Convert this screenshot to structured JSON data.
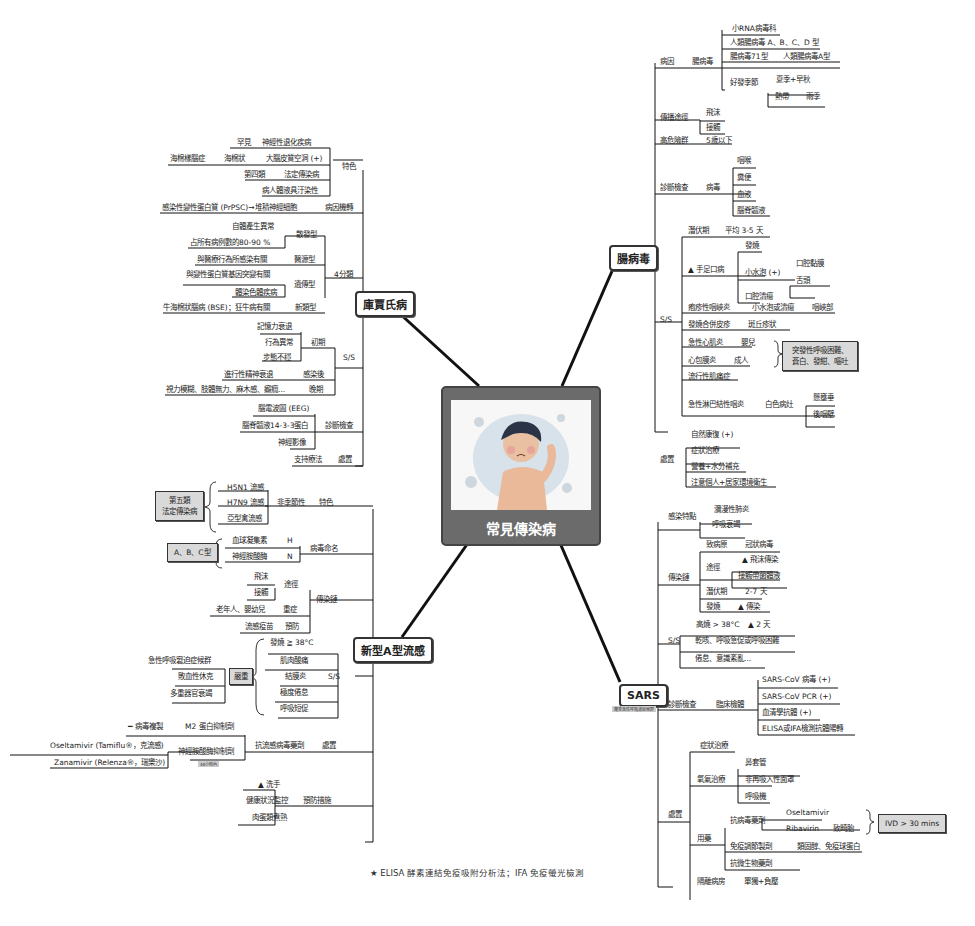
{
  "center": {
    "title": "常見傳染病",
    "image": "sick-child-illustration"
  },
  "footnote": {
    "icon": "star-icon",
    "text": "★ ELISA 酵素連結免疫吸附分析法；IFA 免疫螢光檢測"
  },
  "enterovirus": {
    "label": "腸病毒",
    "cause": {
      "label": "病因",
      "virus": "腸病毒",
      "items": [
        "小RNA病毒科",
        "人類腸病毒 A、B、C、D 型",
        "腸病毒71型",
        "人類腸病毒A型",
        "好發季節",
        "夏季+早秋",
        "熱帶",
        "雨季"
      ]
    },
    "transmission": {
      "label": "傳播途徑",
      "items": [
        "飛沫",
        "接觸"
      ]
    },
    "high_risk": {
      "label": "高危險群",
      "value": "5歲以下"
    },
    "diagnosis": {
      "label": "診斷檢查",
      "sub": "病毒",
      "items": [
        "咽喉",
        "糞便",
        "血液",
        "腦脊髓液"
      ]
    },
    "ss": {
      "label": "S/S",
      "incubation": {
        "label": "潛伏期",
        "value": "平均 3-5 天"
      },
      "hfmd": {
        "label": "手足口病",
        "items": [
          "發燒",
          "小水泡 (+)",
          "口腔黏膜",
          "舌頭",
          "口腔潰瘍"
        ]
      },
      "herpangina": {
        "label": "疱疹性咽峽炎",
        "a": "小水泡或潰瘍",
        "b": "咽峽部"
      },
      "rash": {
        "label": "發燒合併皮疹",
        "value": "斑丘疹狀"
      },
      "myocarditis": {
        "label": "急性心肌炎",
        "value": "嬰兒"
      },
      "pericarditis": {
        "label": "心包膜炎",
        "value": "成人"
      },
      "note": "突發性呼吸困難、蒼白、發紺、嘔吐",
      "myalgia": "流行性肌痛症",
      "pharyngitis": {
        "label": "急性淋巴結性咽炎",
        "value": "白色病灶",
        "items": [
          "懸壅垂",
          "後咽壁"
        ]
      }
    },
    "treatment": {
      "label": "處置",
      "items": [
        "自然康復 (+)",
        "症狀治療",
        "營養+水分補充",
        "注意個人+居家環境衛生"
      ]
    }
  },
  "cjd": {
    "label": "庫賈氏病",
    "features": {
      "label": "特色",
      "items": [
        "罕見",
        "神經性退化疾病",
        "海棉樣腦症",
        "海棉狀",
        "大腦皮質空洞 (+)",
        "第四類",
        "法定傳染病",
        "病人體液具汙染性"
      ]
    },
    "mechanism": {
      "label": "病因機轉",
      "value": "感染性變性蛋白質 (PrPSC)→堆積神經細胞"
    },
    "types": {
      "label": "4分類",
      "items": [
        "自體產生異常",
        "散發型",
        "占所有病例數的80-90 %",
        "與醫療行為所感染有關",
        "醫源型",
        "與變性蛋白質基因突變有關",
        "遺傳型",
        "體染色體疾病",
        "牛海棉狀腦病 (BSE)；狂牛病有關",
        "新類型"
      ]
    },
    "ss": {
      "label": "S/S",
      "items": [
        "記憶力衰退",
        "行為異常",
        "初期",
        "步態不穩",
        "進行性精神衰退",
        "感染後",
        "視力模糊、肢體無力、麻木感、癲癇...",
        "晚期"
      ]
    },
    "diagnosis": {
      "label": "診斷檢查",
      "items": [
        "腦電波圖 (EEG)",
        "腦脊髓液14-3-3蛋白",
        "神經影像"
      ]
    },
    "treatment": {
      "label": "處置",
      "value": "支持療法"
    }
  },
  "flu": {
    "label": "新型A型流感",
    "features": {
      "label": "特色",
      "sub": "非季節性",
      "items": [
        "H5N1 流感",
        "H7N9 流感",
        "亞型禽流感"
      ],
      "box": "第五類\n法定傳染病"
    },
    "naming": {
      "label": "病毒命名",
      "items": [
        "血球凝集素",
        "H",
        "神經胺酸酶",
        "N"
      ],
      "box": "A、B、C型"
    },
    "chain": {
      "label": "傳染鏈",
      "items": [
        "飛沫",
        "接觸",
        "途徑",
        "老年人、嬰幼兒",
        "重症",
        "流感疫苗",
        "預防"
      ]
    },
    "ss": {
      "label": "S/S",
      "items": [
        "發燒 ≧ 38°C",
        "肌肉酸痛",
        "結膜炎",
        "極度倦怠",
        "呼吸短促"
      ],
      "severe": "嚴重",
      "severe_items": [
        "急性呼吸窘迫症候群",
        "敗血性休克",
        "多重器官衰竭"
      ]
    },
    "treatment": {
      "label": "處置",
      "sub": "抗流感病毒藥劑",
      "items": [
        "病毒複製",
        "M2 蛋白抑制劑",
        "Oseltamivir (Tamiflu®，克流感)",
        "神經胺酸酶抑制劑",
        "Zanamivir (Relenza®，瑞樂沙)"
      ],
      "tag": "48小時內"
    },
    "prevention": {
      "label": "預防措施",
      "items": [
        "洗手",
        "健康狀況監控",
        "肉蛋類煮熟"
      ]
    }
  },
  "sars": {
    "label": "SARS",
    "sublabel": "嚴重急性呼吸道症候群",
    "features": {
      "label": "感染特點",
      "items": [
        "瀰漫性肺炎",
        "呼吸衰竭"
      ]
    },
    "chain": {
      "label": "傳染鏈",
      "items": [
        "致病原",
        "冠狀病毒",
        "途徑",
        "飛沫傳染",
        "接觸帶菌體液",
        "潛伏期",
        "2-7 天",
        "發燒",
        "傳染"
      ]
    },
    "ss": {
      "label": "S/S",
      "items": [
        "高燒 > 38°C",
        "2 天",
        "乾咳、呼吸急促或呼吸困難",
        "倦怠、意識紊亂..."
      ]
    },
    "diagnosis": {
      "label": "診斷檢查",
      "sub": "臨床檢體",
      "items": [
        "SARS-CoV 病毒 (+)",
        "SARS-CoV PCR (+)",
        "血清學抗體 (+)",
        "ELISA或IFA檢測抗體陽轉"
      ]
    },
    "treatment": {
      "label": "處置",
      "items": [
        "症狀治療",
        "氧氣治療",
        "鼻套管",
        "非再吸入性面罩",
        "呼吸機",
        "用藥",
        "抗病毒藥劑",
        "Oseltamivir",
        "Ribavirin",
        "致畸胎",
        "免疫調節製劑",
        "類固醇、免疫球蛋白",
        "抗微生物藥劑",
        "隔離病房",
        "單獨+負壓"
      ],
      "box": "IVD > 30 mins"
    }
  }
}
